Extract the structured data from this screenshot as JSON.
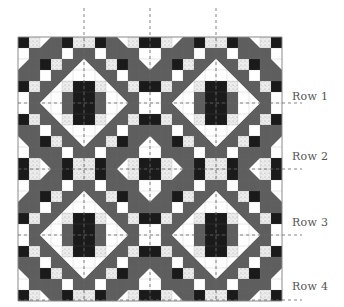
{
  "figure": {
    "row_labels": [
      "Row 1",
      "Row 2",
      "Row 3",
      "Row 4"
    ],
    "row_label_y": [
      103,
      169,
      235,
      300
    ],
    "vertical_guides_x": [
      84,
      150,
      216
    ],
    "grid": {
      "origin_x": 18,
      "origin_y": 37,
      "cell": 11,
      "cols": 24,
      "rows": 24
    },
    "colors": {
      "black": "#1a1a1a",
      "gray": "#5e5e5e",
      "white": "#ffffff",
      "speckled": "#e6e6e6",
      "border": "#8a8a8a",
      "guide": "#666666"
    },
    "quadrant": [
      [
        "K",
        "S",
        "H1",
        "G",
        "K",
        "S"
      ],
      [
        "W",
        "G",
        "G",
        "G",
        "W",
        "G"
      ],
      [
        "H1",
        "G",
        "K",
        "S",
        "G",
        "H2"
      ],
      [
        "G",
        "G",
        "W",
        "G",
        "H2",
        "W"
      ],
      [
        "K",
        "S",
        "G",
        "H2",
        "S",
        "K"
      ],
      [
        "W",
        "G",
        "H2",
        "W",
        "G",
        "K"
      ]
    ]
  }
}
